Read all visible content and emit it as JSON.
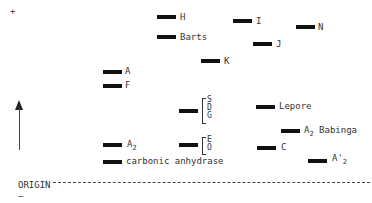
{
  "diagram": {
    "plus_sign": "+",
    "minus_sign": "–",
    "origin_label": "ORIGIN",
    "direction_arrow": "up-arrow-icon",
    "bands": [
      {
        "id": "H",
        "label": "H",
        "x": 157,
        "y": 15,
        "w": 19
      },
      {
        "id": "Barts",
        "label": "Barts",
        "x": 157,
        "y": 35,
        "w": 19
      },
      {
        "id": "I",
        "label": "I",
        "x": 233,
        "y": 19,
        "w": 19
      },
      {
        "id": "N",
        "label": "N",
        "x": 296,
        "y": 25,
        "w": 19
      },
      {
        "id": "J",
        "label": "J",
        "x": 253,
        "y": 42,
        "w": 19
      },
      {
        "id": "K",
        "label": "K",
        "x": 201,
        "y": 59,
        "w": 19
      },
      {
        "id": "A",
        "label": "A",
        "x": 103,
        "y": 70,
        "w": 19
      },
      {
        "id": "F",
        "label": "F",
        "x": 103,
        "y": 84,
        "w": 19
      },
      {
        "id": "Lepore",
        "label": "Lepore",
        "x": 256,
        "y": 105,
        "w": 19
      },
      {
        "id": "A2Babinga",
        "label": "A",
        "sub": "2",
        "suffix": " Babinga",
        "x": 281,
        "y": 129,
        "w": 19
      },
      {
        "id": "A2",
        "label": "A",
        "sub": "2",
        "x": 103,
        "y": 143,
        "w": 19
      },
      {
        "id": "C",
        "label": "C",
        "x": 257,
        "y": 146,
        "w": 19
      },
      {
        "id": "carbonic",
        "label": "carbonic anhydrase",
        "x": 103,
        "y": 160,
        "w": 19
      },
      {
        "id": "A2prime",
        "label": "A'",
        "sub": "2",
        "x": 308,
        "y": 159,
        "w": 19
      }
    ],
    "groups": [
      {
        "id": "SDG",
        "x": 179,
        "y": 109,
        "w": 19,
        "items": [
          "S",
          "D",
          "G"
        ]
      },
      {
        "id": "EO",
        "x": 179,
        "y": 143,
        "w": 19,
        "items": [
          "E",
          "O"
        ]
      }
    ]
  }
}
